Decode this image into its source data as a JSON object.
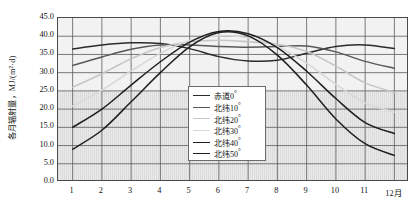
{
  "chart_data": {
    "type": "line",
    "title": "",
    "xlabel": "",
    "ylabel": "各月辐射量，MJ/(m²·d)",
    "x": [
      1,
      2,
      3,
      4,
      5,
      6,
      7,
      8,
      9,
      10,
      11,
      12
    ],
    "xtick_labels": [
      "1",
      "2",
      "3",
      "4",
      "5",
      "6",
      "7",
      "8",
      "9",
      "10",
      "11",
      "12月"
    ],
    "ytick_labels": [
      "45.0",
      "40.0",
      "35.0",
      "30.0",
      "25.0",
      "20.0",
      "15.0",
      "10.0",
      "5.0",
      "0.0"
    ],
    "ytick_values": [
      45.0,
      40.0,
      35.0,
      30.0,
      25.0,
      20.0,
      15.0,
      10.0,
      5.0,
      0.0
    ],
    "ylim": [
      0.0,
      45.0
    ],
    "xlim": [
      0.5,
      12.5
    ],
    "grid": true,
    "legend_position": "center",
    "series": [
      {
        "name": "赤道0°",
        "color": "#2b2b2b",
        "width": 1.5,
        "values": [
          36.5,
          37.6,
          38.2,
          38.0,
          36.6,
          34.4,
          33.2,
          33.4,
          35.3,
          37.2,
          37.6,
          36.6
        ]
      },
      {
        "name": "北纬10°",
        "color": "#585858",
        "width": 1.5,
        "values": [
          32.0,
          34.3,
          36.4,
          37.6,
          37.6,
          37.2,
          37.0,
          37.2,
          37.3,
          35.7,
          33.1,
          31.2
        ]
      },
      {
        "name": "北纬20°",
        "color": "#c6c6c6",
        "width": 1.6,
        "values": [
          26.0,
          29.7,
          33.8,
          36.9,
          38.4,
          38.9,
          38.5,
          37.8,
          35.8,
          31.8,
          27.2,
          24.6
        ]
      },
      {
        "name": "北纬30°",
        "color": "#d8d8d8",
        "width": 1.6,
        "values": [
          20.8,
          25.2,
          30.5,
          35.3,
          38.8,
          40.1,
          39.6,
          37.2,
          32.6,
          26.8,
          21.7,
          19.2
        ]
      },
      {
        "name": "北纬40°",
        "color": "#1f1f1f",
        "width": 1.5,
        "values": [
          15.0,
          20.0,
          26.6,
          33.0,
          38.4,
          41.3,
          40.7,
          36.9,
          30.4,
          22.9,
          16.3,
          13.3
        ]
      },
      {
        "name": "北纬50°",
        "color": "#1f1f1f",
        "width": 1.5,
        "values": [
          9.0,
          14.2,
          22.0,
          30.0,
          37.1,
          41.0,
          40.1,
          34.8,
          26.6,
          17.3,
          10.5,
          7.3
        ]
      }
    ],
    "shaded_band": {
      "from": 0.0,
      "to": 25.0,
      "style": "vertical-hatch"
    }
  }
}
